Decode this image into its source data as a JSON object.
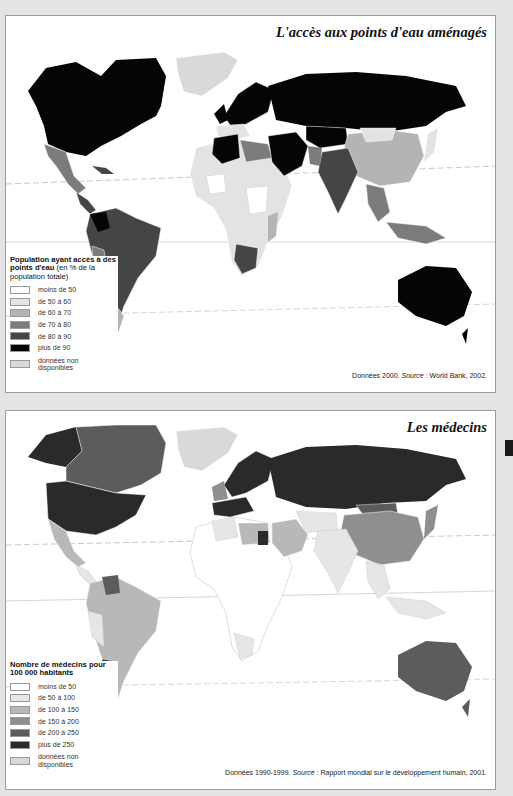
{
  "maps": [
    {
      "title": "L'accès aux points d'eau aménagés",
      "legend": {
        "title": "Population ayant accès à des points d'eau",
        "subtitle": "(en % de la population totale)",
        "items": [
          {
            "label": "moins de 50",
            "color": "#ffffff"
          },
          {
            "label": "de 50 à 60",
            "color": "#e3e3e3"
          },
          {
            "label": "de 60 à 70",
            "color": "#b4b4b4"
          },
          {
            "label": "de 70 à 80",
            "color": "#7c7c7c"
          },
          {
            "label": "de 80 à 90",
            "color": "#454545"
          },
          {
            "label": "plus de 90",
            "color": "#050505"
          },
          {
            "label": "données non disponibles",
            "color": "#d9d9d9"
          }
        ]
      },
      "source_prefix": "Données 2000. ",
      "source_label": "Source",
      "source_text": " : World Bank, 2002."
    },
    {
      "title": "Les médecins",
      "legend": {
        "title": "Nombre de médecins pour 100 000 habitants",
        "subtitle": "",
        "items": [
          {
            "label": "moins de 50",
            "color": "#ffffff"
          },
          {
            "label": "de 50 à 100",
            "color": "#e6e6e6"
          },
          {
            "label": "de 100 à 150",
            "color": "#b8b8b8"
          },
          {
            "label": "de 150 à 200",
            "color": "#8f8f8f"
          },
          {
            "label": "de 200 à 250",
            "color": "#5c5c5c"
          },
          {
            "label": "plus de 250",
            "color": "#2a2a2a"
          },
          {
            "label": "données non disponibles",
            "color": "#d9d9d9"
          }
        ]
      },
      "source_prefix": "Données 1990-1999. ",
      "source_label": "Source",
      "source_text": " : Rapport mondial sur le développement humain, 2001."
    }
  ]
}
